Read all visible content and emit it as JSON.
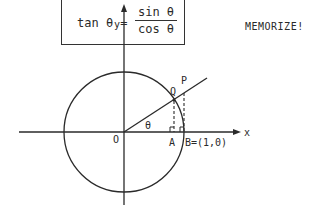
{
  "formula": {
    "lhs": "tan θ =",
    "numerator": "sin θ",
    "denominator": "cos θ"
  },
  "note": "MEMORIZE!",
  "diagram": {
    "axis_labels": {
      "x": "x",
      "y": "y"
    },
    "points": {
      "origin": "O",
      "angle": "θ",
      "A": "A",
      "B": "B=(1,0)",
      "Q": "Q",
      "P": "P"
    },
    "colors": {
      "stroke": "#2a2a2a",
      "background": "#ffffff"
    }
  }
}
